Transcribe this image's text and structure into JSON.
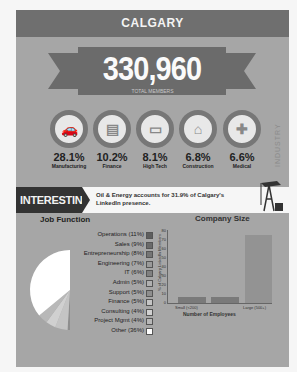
{
  "header": {
    "title": "CALGARY"
  },
  "headline": {
    "value": "330,960",
    "subtitle": "TOTAL MEMBERS"
  },
  "industry": {
    "side_label": "INDUSTRY",
    "items": [
      {
        "icon": "car-icon",
        "glyph": "🚗",
        "percent": "28.1%",
        "label": "Manufacturing"
      },
      {
        "icon": "document-icon",
        "glyph": "▤",
        "percent": "10.2%",
        "label": "Finance"
      },
      {
        "icon": "monitor-icon",
        "glyph": "▭",
        "percent": "8.1%",
        "label": "High Tech"
      },
      {
        "icon": "house-icon",
        "glyph": "⌂",
        "percent": "6.8%",
        "label": "Construction"
      },
      {
        "icon": "medical-cross-icon",
        "glyph": "✚",
        "percent": "6.6%",
        "label": "Medical"
      }
    ]
  },
  "interesting": {
    "tag": "INTERESTING",
    "text": "Oil & Energy accounts for 31.9% of Calgary's LinkedIn presence."
  },
  "job_function": {
    "title": "Job Function",
    "items": [
      {
        "label": "Operations (11%)",
        "value": 11,
        "color": "#5e5e5e"
      },
      {
        "label": "Sales (9%)",
        "value": 9,
        "color": "#6a6a6a"
      },
      {
        "label": "Entrepreneurship (8%)",
        "value": 8,
        "color": "#757575"
      },
      {
        "label": "Engineering (7%)",
        "value": 7,
        "color": "#9a9a9a"
      },
      {
        "label": "IT (6%)",
        "value": 6,
        "color": "#808080"
      },
      {
        "label": "Admin (5%)",
        "value": 5,
        "color": "#b0b0b0"
      },
      {
        "label": "Support (5%)",
        "value": 5,
        "color": "#8e8e8e"
      },
      {
        "label": "Finance (5%)",
        "value": 5,
        "color": "#c4c4c4"
      },
      {
        "label": "Consulting (4%)",
        "value": 4,
        "color": "#d0d0d0"
      },
      {
        "label": "Project Mgmt (4%)",
        "value": 4,
        "color": "#b8b8b8"
      },
      {
        "label": "Other (36%)",
        "value": 36,
        "color": "#ffffff"
      }
    ]
  },
  "company_size": {
    "title": "Company Size",
    "ylabel": "% of Calgary LinkedIn Members",
    "xlabel": "Number of Employees",
    "yticks": [
      "80",
      "70",
      "60",
      "50",
      "40",
      "30",
      "20",
      "10",
      "0"
    ],
    "bars": [
      {
        "label": "Small (<200)",
        "value": 7
      },
      {
        "label": "Medium",
        "value": 7
      },
      {
        "label": "Large (500+)",
        "value": 76
      }
    ],
    "xtick_left": "Small (<200)",
    "xtick_right": "Large (500+)"
  },
  "chart_data": [
    {
      "type": "pie",
      "title": "Job Function",
      "categories": [
        "Operations",
        "Sales",
        "Entrepreneurship",
        "Engineering",
        "IT",
        "Admin",
        "Support",
        "Finance",
        "Consulting",
        "Project Mgmt",
        "Other"
      ],
      "values": [
        11,
        9,
        8,
        7,
        6,
        5,
        5,
        5,
        4,
        4,
        36
      ]
    },
    {
      "type": "bar",
      "title": "Company Size",
      "categories": [
        "Small (<200)",
        "Medium",
        "Large (500+)"
      ],
      "values": [
        7,
        7,
        76
      ],
      "xlabel": "Number of Employees",
      "ylabel": "% of Calgary LinkedIn Members",
      "ylim": [
        0,
        80
      ]
    }
  ]
}
